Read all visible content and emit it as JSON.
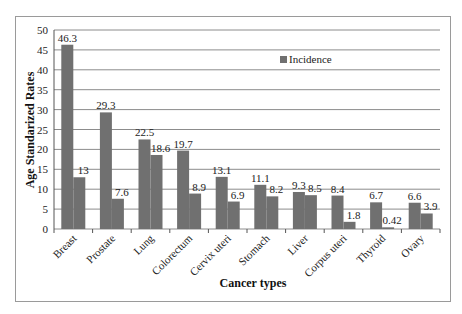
{
  "chart_data": {
    "type": "bar",
    "title": "",
    "xlabel": "Cancer types",
    "ylabel": "Age Standarized Rates",
    "ylim": [
      0,
      50
    ],
    "yticks": [
      0,
      5,
      10,
      15,
      20,
      25,
      30,
      35,
      40,
      45,
      50
    ],
    "grid": true,
    "legend_position": "upper right (inside plot)",
    "categories": [
      "Breast",
      "Prostate",
      "Lung",
      "Colorectum",
      "Cervix uteri",
      "Stomach",
      "Liver",
      "Corpus uteri",
      "Thyroid",
      "Ovary"
    ],
    "series": [
      {
        "name": "Incidence",
        "values": [
          46.3,
          29.3,
          22.5,
          19.7,
          13.1,
          11.1,
          9.3,
          8.4,
          6.7,
          6.6
        ],
        "color": "#707070"
      },
      {
        "name": "",
        "values": [
          13,
          7.6,
          18.6,
          8.9,
          6.9,
          8.2,
          8.5,
          1.8,
          0.42,
          3.9
        ],
        "color": "#707070"
      }
    ],
    "value_labels": [
      [
        "46.3",
        "29.3",
        "22.5",
        "19.7",
        "13.1",
        "11.1",
        "9.3",
        "8.4",
        "6.7",
        "6.6"
      ],
      [
        "13",
        "7.6",
        "18.6",
        "8.9",
        "6.9",
        "8.2",
        "8.5",
        "1.8",
        "0.42",
        "3.9"
      ]
    ]
  },
  "legend": {
    "label": "Incidence"
  }
}
